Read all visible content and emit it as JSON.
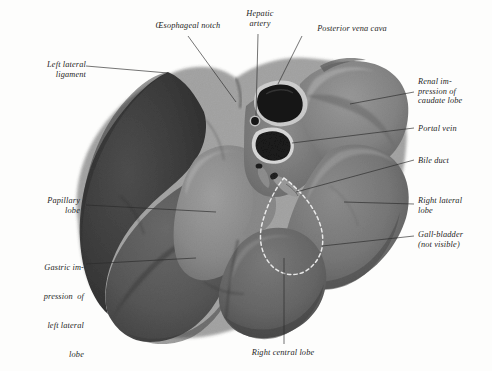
{
  "figure": {
    "style": "grayscale-halftone-photograph",
    "background_color": "#fdfdfc",
    "label_color": "#1d1d1d",
    "leader_color": "#2a2a2a"
  },
  "labels": [
    {
      "id": "oesophageal-notch",
      "text": "Œsophageal notch",
      "align": "center",
      "x": 136,
      "y": 21,
      "w": 104
    },
    {
      "id": "hepatic-artery",
      "text": "Hepatic\nartery",
      "align": "center",
      "x": 238,
      "y": 9,
      "w": 44
    },
    {
      "id": "posterior-vena-cava",
      "text": "Posterior vena cava",
      "align": "center",
      "x": 296,
      "y": 24,
      "w": 112
    },
    {
      "id": "left-lateral-ligament",
      "text": "Left lateral\nligament",
      "align": "right",
      "x": 8,
      "y": 60,
      "w": 78
    },
    {
      "id": "renal-impression",
      "text": "Renal im-\npression of\ncaudate lobe",
      "align": "left",
      "x": 418,
      "y": 77,
      "w": 72
    },
    {
      "id": "portal-vein",
      "text": "Portal vein",
      "align": "left",
      "x": 418,
      "y": 124,
      "w": 72
    },
    {
      "id": "bile-duct",
      "text": "Bile duct",
      "align": "left",
      "x": 418,
      "y": 156,
      "w": 72
    },
    {
      "id": "papillary-lobe",
      "text": "Papillary\nlobe",
      "align": "right",
      "x": 6,
      "y": 196,
      "w": 74
    },
    {
      "id": "right-lateral-lobe",
      "text": "Right lateral\nlobe",
      "align": "left",
      "x": 418,
      "y": 196,
      "w": 74
    },
    {
      "id": "gall-bladder",
      "text": "Gall-bladder\n(not visible)",
      "align": "left",
      "x": 418,
      "y": 230,
      "w": 74
    },
    {
      "id": "gastric-impression",
      "text": "Gastric impression of\nleft lateral\nlobe",
      "align": "right",
      "x": 4,
      "y": 244,
      "w": 80
    },
    {
      "id": "right-central-lobe",
      "text": "Right central lobe",
      "align": "center",
      "x": 228,
      "y": 348,
      "w": 110
    }
  ],
  "gastric_impression_lines": [
    "Gastric im-",
    "pression  of",
    "left lateral",
    "lobe"
  ],
  "renal_impression_lines": [
    "Renal im-",
    "pression  of",
    "caudate lobe"
  ],
  "structures": [
    {
      "id": "posterior-vena-cava-opening",
      "name": "posterior vena cava opening"
    },
    {
      "id": "hepatic-artery-opening",
      "name": "hepatic artery opening"
    },
    {
      "id": "portal-vein-opening",
      "name": "portal vein opening"
    },
    {
      "id": "bile-duct-stub",
      "name": "bile duct stub"
    },
    {
      "id": "gall-bladder-outline",
      "name": "gall-bladder dashed outline"
    }
  ]
}
